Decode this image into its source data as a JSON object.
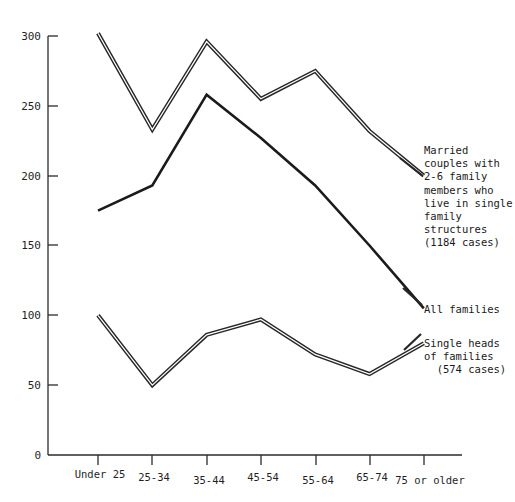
{
  "chart_data": {
    "type": "line",
    "title": "",
    "xlabel": "",
    "ylabel": "",
    "categories": [
      "Under 25",
      "25-34",
      "35-44",
      "45-54",
      "55-64",
      "65-74",
      "75 or older"
    ],
    "ylim": [
      0,
      300
    ],
    "yticks": [
      0,
      50,
      100,
      150,
      200,
      250,
      300
    ],
    "ytick_labels": [
      "0",
      "50",
      "100",
      "150",
      "200",
      "250",
      "300"
    ],
    "grid": false,
    "legend_position": "right-inline-annotations",
    "series": [
      {
        "name": "Married couples with 2-6 family members who live in single family structures",
        "style": "double-line",
        "values": [
          302,
          233,
          296,
          255,
          275,
          232,
          200
        ]
      },
      {
        "name": "All families",
        "style": "solid-line",
        "values": [
          175,
          193,
          258,
          227,
          193,
          150,
          105
        ]
      },
      {
        "name": "Single heads of families",
        "style": "double-line",
        "values": [
          100,
          50,
          86,
          97,
          72,
          58,
          80
        ]
      }
    ],
    "annotations": [
      {
        "id": "married",
        "text": "Married\ncouples with\n2-6 family\nmembers who\nlive in single\nfamily\nstructures\n(1184 cases)",
        "points_to_series": "Married couples with 2-6 family members who live in single family structures"
      },
      {
        "id": "all-families",
        "text": "All families",
        "points_to_series": "All families"
      },
      {
        "id": "single-heads",
        "text": "Single heads\nof families\n  (574 cases)",
        "points_to_series": "Single heads of families"
      }
    ]
  }
}
